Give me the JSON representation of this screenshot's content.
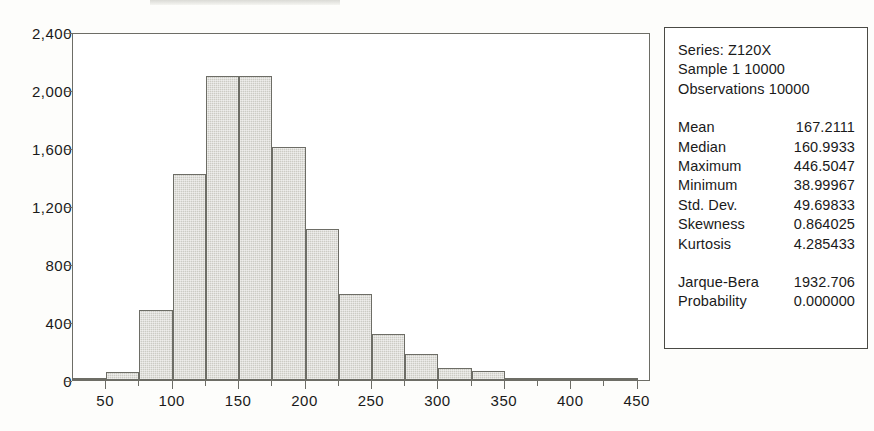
{
  "chart_data": {
    "type": "bar",
    "title": "",
    "xlabel": "",
    "ylabel": "",
    "grid": false,
    "legend_position": "none",
    "xlim": [
      25,
      460
    ],
    "ylim": [
      0,
      2400
    ],
    "bin_width": 25,
    "x_ticks": [
      50,
      100,
      150,
      200,
      250,
      300,
      350,
      400,
      450
    ],
    "x_minor_tick_step": 25,
    "y_ticks": [
      0,
      400,
      800,
      1200,
      1600,
      2000,
      2400
    ],
    "y_tick_labels": [
      "0",
      "400",
      "800",
      "1,200",
      "1,600",
      "2,000",
      "2,400"
    ],
    "bar_fill_color": "#cccbc4",
    "bar_border_color": "#6d6d66",
    "categories": [
      "25-50",
      "50-75",
      "75-100",
      "100-125",
      "125-150",
      "150-175",
      "175-200",
      "200-225",
      "225-250",
      "250-275",
      "275-300",
      "300-325",
      "325-350",
      "350-375",
      "375-400",
      "400-425",
      "425-450"
    ],
    "bin_starts": [
      25,
      50,
      75,
      100,
      125,
      150,
      175,
      200,
      225,
      250,
      275,
      300,
      325,
      350,
      375,
      400,
      425
    ],
    "values": [
      5,
      55,
      480,
      1420,
      2100,
      2095,
      1605,
      1040,
      595,
      315,
      180,
      85,
      60,
      15,
      8,
      5,
      3
    ]
  },
  "stats_panel": {
    "header": [
      "Series: Z120X",
      "Sample 1 10000",
      "Observations 10000"
    ],
    "rows": [
      {
        "label": "Mean",
        "value": "167.2111"
      },
      {
        "label": "Median",
        "value": "160.9933"
      },
      {
        "label": "Maximum",
        "value": "446.5047"
      },
      {
        "label": "Minimum",
        "value": "38.99967"
      },
      {
        "label": "Std. Dev.",
        "value": "49.69833"
      },
      {
        "label": "Skewness",
        "value": "0.864025"
      },
      {
        "label": "Kurtosis",
        "value": "4.285433"
      }
    ],
    "test_rows": [
      {
        "label": "Jarque-Bera",
        "value": "1932.706"
      },
      {
        "label": "Probability",
        "value": "0.000000"
      }
    ]
  }
}
